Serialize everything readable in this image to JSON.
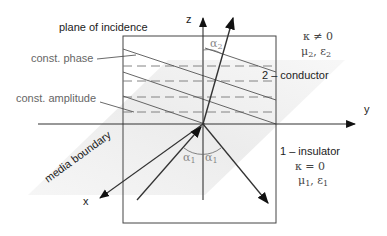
{
  "diagram": {
    "title": "plane of incidence",
    "labels": {
      "const_phase": "const. phase",
      "const_amplitude": "const. amplitude",
      "media_boundary": "media boundary",
      "conductor": "2 – conductor",
      "insulator": "1 – insulator"
    },
    "axes": {
      "x": "x",
      "y": "y",
      "z": "z"
    },
    "medium2": {
      "kappa": "κ ≠ 0",
      "mu_eps": "μ",
      "mu_sub": "2",
      "eps": ", ε",
      "eps_sub": "2"
    },
    "medium1": {
      "kappa": "κ  =  0",
      "mu_eps": "μ",
      "mu_sub": "1",
      "eps": ", ε",
      "eps_sub": "1"
    },
    "angles": {
      "alpha": "α",
      "refracted_sub": "2",
      "incident_sub": "1",
      "reflected_sub": "1"
    },
    "colors": {
      "line": "#333333",
      "thin": "#555555",
      "shade": "#ececec",
      "frame": "#444444"
    }
  }
}
